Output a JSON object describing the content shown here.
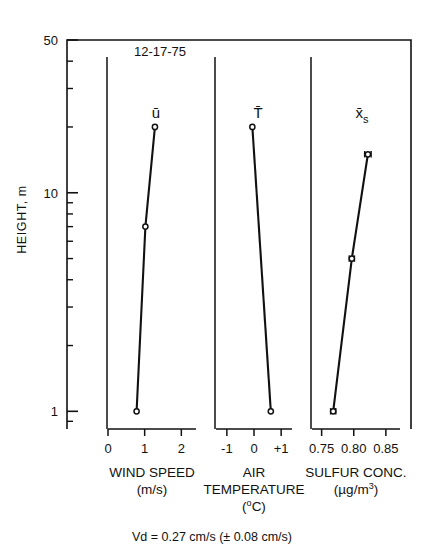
{
  "figure": {
    "date_label": "12-17-75",
    "caption": "Vd  =  0.27 cm/s (± 0.08 cm/s)",
    "y_axis_title": "HEIGHT, m"
  },
  "chart_data": {
    "type": "line",
    "title": "12-17-75",
    "subtitle": "Vd  =  0.27 cm/s (± 0.08 cm/s)",
    "ylabel": "HEIGHT, m",
    "yscale": "log",
    "ylim": [
      0.8,
      50
    ],
    "y_tick_labels": [
      "50",
      "10",
      "1"
    ],
    "y_major_ticks": [
      50,
      10,
      1
    ],
    "y_minor_ticks": [
      40,
      30,
      20,
      9,
      8,
      7,
      6,
      5,
      4,
      3,
      2,
      0.9
    ],
    "grid": false,
    "legend": "none",
    "panels": [
      {
        "name": "wind-speed",
        "series_symbol": "ū",
        "xlabel": "WIND SPEED",
        "xunits": "(m/s)",
        "xlim": [
          0,
          2.4
        ],
        "x_tick_values": [
          0,
          1,
          2
        ],
        "x_tick_labels": [
          "0",
          "1",
          "2"
        ],
        "marker": "open-circle",
        "error_bars": false,
        "points": [
          {
            "x": 0.78,
            "y": 1.0
          },
          {
            "x": 1.02,
            "y": 7.0
          },
          {
            "x": 1.28,
            "y": 20.0
          }
        ]
      },
      {
        "name": "air-temperature",
        "series_symbol": "T̄",
        "xlabel": "AIR TEMPERATURE",
        "xunits": "(°C)",
        "xlim": [
          -1.4,
          1.4
        ],
        "x_tick_values": [
          -1,
          0,
          1
        ],
        "x_tick_labels": [
          "-1",
          "0",
          "+1"
        ],
        "marker": "open-circle",
        "error_bars": false,
        "points": [
          {
            "x": 0.62,
            "y": 1.0
          },
          {
            "x": -0.06,
            "y": 20.0
          }
        ]
      },
      {
        "name": "sulfur-concentration",
        "series_symbol": "x̄",
        "series_subscript": "s",
        "xlabel": "SULFUR CONC.",
        "xunits": "(µg/m³)",
        "xlim": [
          0.735,
          0.872
        ],
        "x_tick_values": [
          0.75,
          0.8,
          0.85
        ],
        "x_tick_labels": [
          "0.75",
          "0.80",
          "0.85"
        ],
        "marker": "open-circle",
        "error_bars": true,
        "points": [
          {
            "x": 0.768,
            "y": 1.0,
            "xerr": 0.004
          },
          {
            "x": 0.797,
            "y": 5.0,
            "xerr": 0.004
          },
          {
            "x": 0.822,
            "y": 15.0,
            "xerr": 0.005
          }
        ]
      }
    ]
  }
}
